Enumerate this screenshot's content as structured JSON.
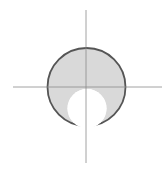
{
  "diagram": {
    "type": "geometric-construction",
    "colors": {
      "background": "#ffffff",
      "axis": "#8c8c8c",
      "outer_fill": "#d9d9d9",
      "outer_stroke": "#555555",
      "inner_fill": "#ffffff"
    },
    "axes": {
      "vertical": {
        "x": 86,
        "y1": 10,
        "y2": 163
      },
      "horizontal": {
        "y": 87,
        "x1": 13,
        "x2": 162
      }
    },
    "outer_circle": {
      "cx": 86.5,
      "cy": 87,
      "r": 39
    },
    "inner_circle": {
      "cx": 87,
      "cy": 108.5,
      "r": 19.5
    }
  }
}
